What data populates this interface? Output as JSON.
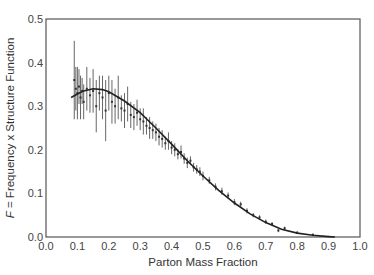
{
  "chart_data": {
    "type": "scatter",
    "title": "",
    "xlabel": "Parton Mass Fraction",
    "ylabel_italic": "F",
    "ylabel_rest": " = Frequency x Structure Function",
    "xlim": [
      0.0,
      1.0
    ],
    "ylim": [
      0.0,
      0.5
    ],
    "grid": false,
    "legend": null,
    "x_ticks": [
      "0.0",
      "0.1",
      "0.2",
      "0.3",
      "0.4",
      "0.5",
      "0.6",
      "0.7",
      "0.8",
      "0.9",
      "1.0"
    ],
    "y_ticks": [
      "0.0",
      "0.1",
      "0.2",
      "0.3",
      "0.4",
      "0.5"
    ],
    "fit_curve": {
      "name": "fit",
      "x": [
        0.08,
        0.1,
        0.12,
        0.15,
        0.18,
        0.2,
        0.25,
        0.3,
        0.35,
        0.4,
        0.45,
        0.5,
        0.55,
        0.6,
        0.65,
        0.7,
        0.75,
        0.8,
        0.85,
        0.9,
        0.92
      ],
      "y": [
        0.32,
        0.328,
        0.335,
        0.34,
        0.338,
        0.333,
        0.312,
        0.285,
        0.25,
        0.213,
        0.175,
        0.14,
        0.107,
        0.078,
        0.053,
        0.033,
        0.018,
        0.009,
        0.004,
        0.001,
        0.0
      ]
    },
    "points": {
      "name": "measurements",
      "x": [
        0.09,
        0.095,
        0.1,
        0.105,
        0.11,
        0.115,
        0.12,
        0.13,
        0.14,
        0.15,
        0.16,
        0.17,
        0.18,
        0.19,
        0.2,
        0.21,
        0.22,
        0.23,
        0.24,
        0.25,
        0.26,
        0.27,
        0.28,
        0.29,
        0.3,
        0.31,
        0.32,
        0.33,
        0.34,
        0.35,
        0.36,
        0.37,
        0.38,
        0.39,
        0.4,
        0.41,
        0.42,
        0.43,
        0.44,
        0.45,
        0.46,
        0.47,
        0.48,
        0.49,
        0.5,
        0.52,
        0.54,
        0.56,
        0.58,
        0.6,
        0.62,
        0.64,
        0.66,
        0.68,
        0.7,
        0.72,
        0.74,
        0.76,
        0.8,
        0.85
      ],
      "y": [
        0.36,
        0.34,
        0.33,
        0.345,
        0.32,
        0.335,
        0.31,
        0.34,
        0.325,
        0.335,
        0.3,
        0.33,
        0.32,
        0.29,
        0.33,
        0.31,
        0.3,
        0.32,
        0.295,
        0.29,
        0.305,
        0.28,
        0.275,
        0.285,
        0.27,
        0.265,
        0.255,
        0.25,
        0.245,
        0.24,
        0.23,
        0.225,
        0.215,
        0.22,
        0.205,
        0.2,
        0.19,
        0.195,
        0.18,
        0.17,
        0.175,
        0.16,
        0.155,
        0.15,
        0.14,
        0.13,
        0.115,
        0.105,
        0.095,
        0.08,
        0.075,
        0.06,
        0.05,
        0.045,
        0.035,
        0.03,
        0.015,
        0.02,
        0.01,
        0.005
      ],
      "err": [
        0.09,
        0.05,
        0.06,
        0.04,
        0.05,
        0.03,
        0.04,
        0.05,
        0.04,
        0.05,
        0.06,
        0.04,
        0.05,
        0.07,
        0.04,
        0.05,
        0.04,
        0.05,
        0.03,
        0.04,
        0.04,
        0.03,
        0.03,
        0.03,
        0.025,
        0.03,
        0.02,
        0.025,
        0.02,
        0.02,
        0.02,
        0.02,
        0.015,
        0.02,
        0.015,
        0.015,
        0.012,
        0.015,
        0.012,
        0.012,
        0.01,
        0.01,
        0.01,
        0.01,
        0.01,
        0.008,
        0.008,
        0.008,
        0.007,
        0.007,
        0.006,
        0.006,
        0.005,
        0.005,
        0.005,
        0.004,
        0.004,
        0.004,
        0.003,
        0.003
      ]
    }
  },
  "colors": {
    "background": "#ffffff",
    "axis": "#555555",
    "curve": "#222222",
    "errorbar": "#666666",
    "point": "#333333"
  }
}
